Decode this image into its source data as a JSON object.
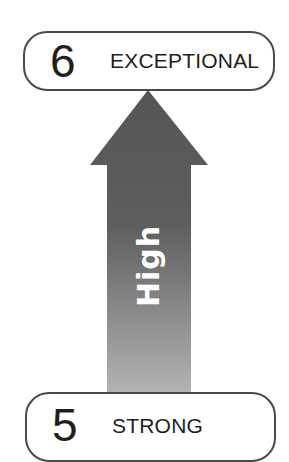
{
  "diagram": {
    "top_level": {
      "number": "6",
      "label": "EXCEPTIONAL"
    },
    "bottom_level": {
      "number": "5",
      "label": "STRONG"
    },
    "arrow": {
      "label": "High",
      "direction": "up",
      "colors": {
        "top": "#555555",
        "bottom": "#b0b0b0"
      }
    },
    "colors": {
      "border": "#4a4a4a",
      "text": "#1e1e1e",
      "background": "#ffffff"
    }
  }
}
